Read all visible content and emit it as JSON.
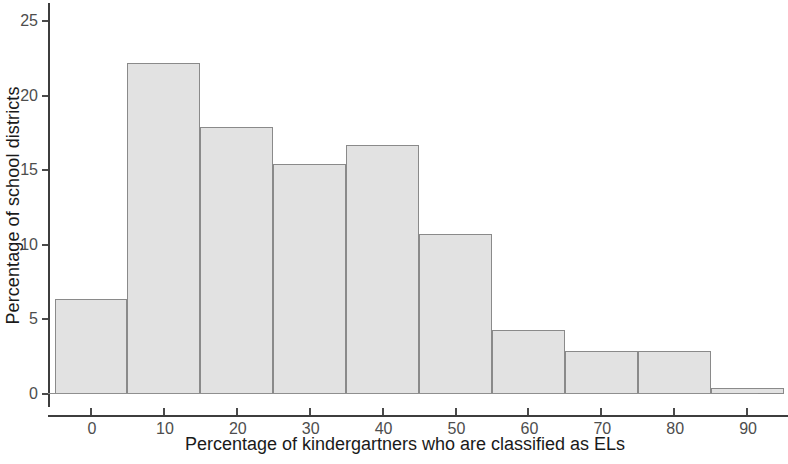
{
  "chart_data": {
    "type": "bar",
    "title": "",
    "subtitle": "",
    "xlabel": "Percentage of kindergartners who are classified as ELs",
    "ylabel": "Percentage of school districts",
    "bin_width": 10,
    "bin_edges": [
      -5,
      5,
      15,
      25,
      35,
      45,
      55,
      65,
      75,
      85,
      95
    ],
    "categories": [
      "-5 to 5",
      "5 to 15",
      "15 to 25",
      "25 to 35",
      "35 to 45",
      "45 to 55",
      "55 to 65",
      "65 to 75",
      "75 to 85",
      "85 to 95"
    ],
    "bin_centers": [
      0,
      10,
      20,
      30,
      40,
      50,
      60,
      70,
      80,
      90
    ],
    "values": [
      6.4,
      22.2,
      17.9,
      15.4,
      16.7,
      10.7,
      4.3,
      2.9,
      2.9,
      0.4
    ],
    "xlim": [
      -8,
      97
    ],
    "ylim": [
      0,
      25.8
    ],
    "xticks": [
      0,
      10,
      20,
      30,
      40,
      50,
      60,
      70,
      80,
      90
    ],
    "xtick_labels": [
      "0",
      "10",
      "20",
      "30",
      "40",
      "50",
      "60",
      "70",
      "80",
      "90"
    ],
    "yticks": [
      0,
      5,
      10,
      15,
      20,
      25
    ],
    "ytick_labels": [
      "0",
      "5",
      "10",
      "15",
      "20",
      "25"
    ],
    "grid": false,
    "legend": false,
    "colors": {
      "bar_fill": "#e2e2e2",
      "bar_border": "#8a8a8a",
      "axis": "#3d3d3d",
      "tick_label": "#4d4d4d",
      "axis_title": "#1a1a1a",
      "background": "#ffffff"
    }
  }
}
